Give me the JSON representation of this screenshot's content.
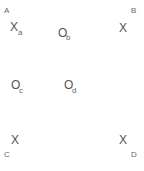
{
  "diagram": {
    "corners": [
      {
        "id": "A",
        "label": "A",
        "x": 4,
        "y": 7
      },
      {
        "id": "B",
        "label": "B",
        "x": 131,
        "y": 7
      },
      {
        "id": "C",
        "label": "C",
        "x": 4,
        "y": 151
      },
      {
        "id": "D",
        "label": "D",
        "x": 131,
        "y": 151
      }
    ],
    "markers": [
      {
        "id": "a",
        "symbol": "X",
        "subscript": "a",
        "x": 10,
        "y": 21,
        "sx": 18,
        "sy": 29
      },
      {
        "id": "b",
        "symbol": "O",
        "subscript": "b",
        "x": 58,
        "y": 27,
        "sx": 66,
        "sy": 34
      },
      {
        "id": "B-mark",
        "symbol": "X",
        "subscript": "",
        "x": 119,
        "y": 22,
        "sx": 0,
        "sy": 0
      },
      {
        "id": "c",
        "symbol": "O",
        "subscript": "c",
        "x": 11,
        "y": 79,
        "sx": 19,
        "sy": 87
      },
      {
        "id": "d",
        "symbol": "O",
        "subscript": "d",
        "x": 64,
        "y": 79,
        "sx": 72,
        "sy": 87
      },
      {
        "id": "C-mark",
        "symbol": "X",
        "subscript": "",
        "x": 11,
        "y": 134,
        "sx": 0,
        "sy": 0
      },
      {
        "id": "D-mark",
        "symbol": "X",
        "subscript": "",
        "x": 119,
        "y": 134,
        "sx": 0,
        "sy": 0
      }
    ]
  }
}
